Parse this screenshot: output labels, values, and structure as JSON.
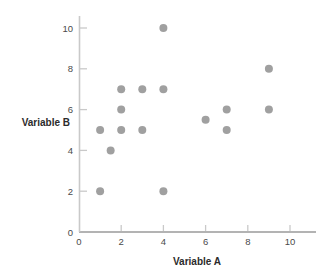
{
  "chart_data": {
    "type": "scatter",
    "title": "",
    "xlabel": "Variable A",
    "ylabel": "Variable B",
    "xlim": [
      0,
      11
    ],
    "ylim": [
      0,
      10.8
    ],
    "xticks": [
      0,
      2,
      4,
      6,
      8,
      10
    ],
    "yticks": [
      0,
      2,
      4,
      6,
      8,
      10
    ],
    "xtick_labels": [
      "0",
      "2",
      "4",
      "6",
      "8",
      "10"
    ],
    "ytick_labels": [
      "0",
      "2",
      "4",
      "6",
      "8",
      "10"
    ],
    "grid": false,
    "legend": false,
    "marker_color": "#a0a0a0",
    "marker_size": 4,
    "points": [
      {
        "x": 1,
        "y": 2
      },
      {
        "x": 1,
        "y": 5
      },
      {
        "x": 1.5,
        "y": 4
      },
      {
        "x": 2,
        "y": 5
      },
      {
        "x": 2,
        "y": 6
      },
      {
        "x": 2,
        "y": 7
      },
      {
        "x": 3,
        "y": 5
      },
      {
        "x": 3,
        "y": 7
      },
      {
        "x": 4,
        "y": 2
      },
      {
        "x": 4,
        "y": 7
      },
      {
        "x": 4,
        "y": 10
      },
      {
        "x": 6,
        "y": 5.5
      },
      {
        "x": 7,
        "y": 5
      },
      {
        "x": 7,
        "y": 6
      },
      {
        "x": 9,
        "y": 6
      },
      {
        "x": 9,
        "y": 8
      }
    ],
    "x": [
      1,
      1,
      1.5,
      2,
      2,
      2,
      3,
      3,
      4,
      4,
      4,
      6,
      7,
      7,
      9,
      9
    ],
    "values": [
      2,
      5,
      4,
      5,
      6,
      7,
      5,
      7,
      2,
      7,
      10,
      5.5,
      5,
      6,
      6,
      8
    ]
  },
  "colors": {
    "marker": "#a0a0a0",
    "axis": "#b3b3b3",
    "axis_minor": "#c9c9c9",
    "tick_text": "#4a4a4a",
    "title_text": "#2b2b2b",
    "background": "#ffffff"
  }
}
